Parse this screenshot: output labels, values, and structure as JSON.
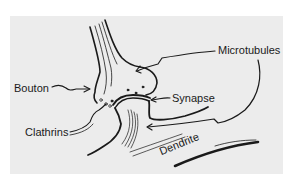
{
  "diagram": {
    "type": "biological line drawing",
    "background_color": "#ececec",
    "line_color": "#1a1a1a",
    "labels": {
      "bouton": "Bouton",
      "microtubules": "Microtubules",
      "synapse": "Synapse",
      "clathrins": "Clathrins",
      "dendrite": "Dendrite"
    },
    "structures": [
      {
        "name": "axon",
        "description": "descending axon with internal microtubule lines"
      },
      {
        "name": "bouton",
        "description": "swollen presynaptic terminal with dotted vesicles"
      },
      {
        "name": "synaptic cleft",
        "description": "curved double line between bouton and spine"
      },
      {
        "name": "dendritic spine",
        "description": "mushroom-shaped postsynaptic protrusion with microtubules"
      },
      {
        "name": "dendrite",
        "description": "dendritic shaft drawn as thick tapered strokes"
      }
    ],
    "arrows": [
      {
        "from": "Bouton",
        "to": "bouton terminal"
      },
      {
        "from": "Microtubules",
        "to": "axon microtubules"
      },
      {
        "from": "Microtubules",
        "to": "spine microtubules"
      },
      {
        "from": "Synapse",
        "to": "synaptic cleft"
      },
      {
        "from": "Clathrins",
        "to": "coated vesicles near bouton base"
      }
    ]
  }
}
